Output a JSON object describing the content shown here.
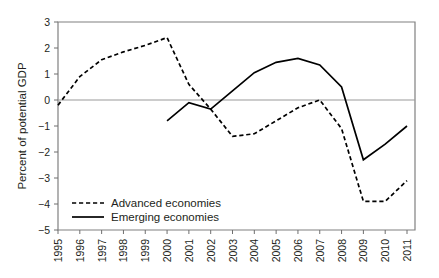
{
  "chart_data": {
    "type": "line",
    "title": "",
    "xlabel": "",
    "ylabel": "Percent of potential GDP",
    "ylim": [
      -5,
      3
    ],
    "ytick_labels": [
      "3",
      "2",
      "1",
      "0",
      "-1",
      "-2",
      "-3",
      "-4",
      "-5"
    ],
    "ytick_values": [
      3,
      2,
      1,
      0,
      -1,
      -2,
      -3,
      -4,
      -5
    ],
    "grid": false,
    "zero_line": true,
    "legend_position": "bottom-left",
    "categories": [
      "1995",
      "1996",
      "1997",
      "1998",
      "1999",
      "2000",
      "2001",
      "2002",
      "2003",
      "2004",
      "2005",
      "2006",
      "2007",
      "2008",
      "2009",
      "2010",
      "2011"
    ],
    "x": [
      1995,
      1996,
      1997,
      1998,
      1999,
      2000,
      2001,
      2002,
      2003,
      2004,
      2005,
      2006,
      2007,
      2008,
      2009,
      2010,
      2011
    ],
    "xlim": [
      1995,
      2011
    ],
    "series": [
      {
        "name": "Advanced economies",
        "style": "dashed",
        "color": "#000000",
        "x": [
          1995,
          1996,
          1997,
          1998,
          1999,
          2000,
          2001,
          2002,
          2003,
          2004,
          2005,
          2006,
          2007,
          2008,
          2009,
          2010,
          2011
        ],
        "values": [
          -0.2,
          0.9,
          1.55,
          1.85,
          2.1,
          2.4,
          0.6,
          -0.35,
          -1.4,
          -1.3,
          -0.8,
          -0.3,
          0.0,
          -1.1,
          -3.9,
          -3.9,
          -3.1
        ]
      },
      {
        "name": "Emerging economies",
        "style": "solid",
        "color": "#000000",
        "x": [
          2000,
          2001,
          2002,
          2003,
          2004,
          2005,
          2006,
          2007,
          2008,
          2009,
          2010,
          2011
        ],
        "values": [
          -0.8,
          -0.1,
          -0.35,
          0.35,
          1.05,
          1.45,
          1.6,
          1.35,
          0.5,
          -2.3,
          -1.7,
          -1.0
        ]
      }
    ]
  },
  "legend": {
    "items": [
      {
        "label": "Advanced economies",
        "style": "dashed"
      },
      {
        "label": "Emerging economies",
        "style": "solid"
      }
    ]
  },
  "axes": {
    "y_title": "Percent of potential GDP"
  }
}
